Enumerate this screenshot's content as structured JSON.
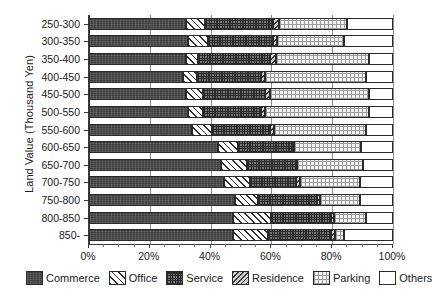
{
  "chart_data": {
    "type": "bar",
    "orientation": "horizontal",
    "stacked": true,
    "normalized": true,
    "title": "",
    "xlabel": "",
    "ylabel": "Land Value (Thousand Yen)",
    "xlim": [
      0,
      100
    ],
    "xticks": [
      0,
      20,
      40,
      60,
      80,
      100
    ],
    "xticklabels": [
      "0%",
      "20%",
      "40%",
      "60%",
      "80%",
      "100%"
    ],
    "grid": true,
    "grid_axis": "x",
    "legend_position": "bottom",
    "categories": [
      "250-300",
      "300-350",
      "350-400",
      "400-450",
      "450-500",
      "500-550",
      "550-600",
      "600-650",
      "650-700",
      "700-750",
      "750-800",
      "800-850",
      "850-"
    ],
    "series": [
      {
        "name": "Commerce",
        "fill": "commerce",
        "values": [
          32.0,
          32.5,
          32.0,
          31.0,
          32.0,
          32.5,
          34.0,
          42.5,
          43.5,
          44.5,
          48.0,
          47.5,
          47.5
        ]
      },
      {
        "name": "Office",
        "fill": "office",
        "values": [
          6.0,
          6.5,
          4.0,
          4.5,
          5.5,
          5.0,
          6.5,
          6.5,
          8.5,
          8.5,
          7.5,
          12.5,
          11.5
        ]
      },
      {
        "name": "Service",
        "fill": "service",
        "values": [
          22.5,
          21.5,
          23.5,
          21.0,
          20.5,
          19.0,
          19.0,
          18.0,
          16.0,
          15.0,
          19.5,
          19.5,
          20.5
        ]
      },
      {
        "name": "Residence",
        "fill": "residence",
        "values": [
          2.0,
          1.5,
          2.0,
          1.5,
          1.5,
          1.5,
          1.5,
          0.5,
          0.5,
          1.5,
          1.0,
          1.0,
          1.5
        ]
      },
      {
        "name": "Parking",
        "fill": "parking",
        "values": [
          22.5,
          22.0,
          30.5,
          33.0,
          32.5,
          34.0,
          30.0,
          22.0,
          21.5,
          19.5,
          13.0,
          10.5,
          3.0
        ]
      },
      {
        "name": "Others",
        "fill": "others",
        "values": [
          15.0,
          16.0,
          8.0,
          9.0,
          8.0,
          8.0,
          9.0,
          10.5,
          10.0,
          11.0,
          11.0,
          9.0,
          16.0
        ]
      }
    ],
    "legend": [
      {
        "label": "Commerce",
        "fill": "commerce"
      },
      {
        "label": "Office",
        "fill": "office"
      },
      {
        "label": "Service",
        "fill": "service"
      },
      {
        "label": "Residence",
        "fill": "residence"
      },
      {
        "label": "Parking",
        "fill": "parking"
      },
      {
        "label": "Others",
        "fill": "others"
      }
    ]
  }
}
